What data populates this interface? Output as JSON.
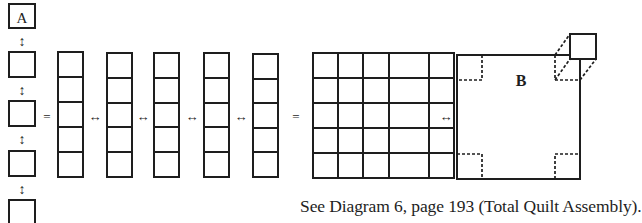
{
  "diagram": {
    "block_a_label": "A",
    "block_b_label": "B",
    "equals_symbol": "=",
    "horizontal_arrow": "↔",
    "vertical_arrow": "↕",
    "stack_block_count": 5,
    "column_count": 5,
    "cells_per_column": 5,
    "grid_rows": 5,
    "grid_cols": 5
  },
  "caption": {
    "text": "See Diagram 6, page 193 (Total Quilt Assembly)."
  }
}
